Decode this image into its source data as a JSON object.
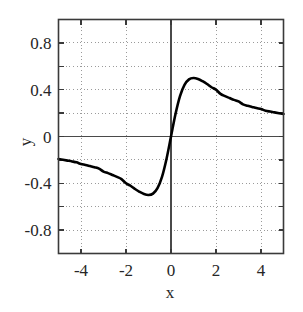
{
  "chart_data": {
    "type": "line",
    "title": "",
    "subtitle": "",
    "xlabel": "x",
    "ylabel": "y",
    "xlim": [
      -5,
      5
    ],
    "ylim": [
      -1.0,
      1.0
    ],
    "grid": true,
    "grid_style": "dotted",
    "legend": null,
    "legend_position": "none",
    "xticks": [
      -4,
      -2,
      0,
      2,
      4
    ],
    "xtick_labels": [
      "-4",
      "-2",
      "0",
      "2",
      "4"
    ],
    "yticks": [
      0.8,
      0.4,
      0,
      -0.4,
      -0.8
    ],
    "ytick_labels": [
      "0.8",
      "0.4",
      "0",
      "-0.4",
      "-0.8"
    ],
    "x_minor_step": 1,
    "y_minor_step": 0.2,
    "series": [
      {
        "name": "y = x/(1+x^2)",
        "color": "#000000",
        "line_width": 2.6,
        "x": [
          -5.0,
          -4.8,
          -4.6,
          -4.4,
          -4.2,
          -4.0,
          -3.8,
          -3.6,
          -3.4,
          -3.2,
          -3.0,
          -2.8,
          -2.6,
          -2.4,
          -2.2,
          -2.0,
          -1.8,
          -1.6,
          -1.4,
          -1.2,
          -1.0,
          -0.8,
          -0.6,
          -0.4,
          -0.2,
          0.0,
          0.2,
          0.4,
          0.6,
          0.8,
          1.0,
          1.2,
          1.4,
          1.6,
          1.8,
          2.0,
          2.2,
          2.4,
          2.6,
          2.8,
          3.0,
          3.2,
          3.4,
          3.6,
          3.8,
          4.0,
          4.2,
          4.4,
          4.6,
          4.8,
          5.0
        ],
        "y": [
          -0.192,
          -0.199,
          -0.206,
          -0.213,
          -0.221,
          -0.235,
          -0.243,
          -0.253,
          -0.263,
          -0.275,
          -0.3,
          -0.313,
          -0.329,
          -0.345,
          -0.364,
          -0.4,
          -0.421,
          -0.449,
          -0.473,
          -0.492,
          -0.5,
          -0.488,
          -0.441,
          -0.345,
          -0.192,
          0.0,
          0.192,
          0.345,
          0.441,
          0.488,
          0.5,
          0.492,
          0.473,
          0.449,
          0.421,
          0.4,
          0.364,
          0.345,
          0.329,
          0.313,
          0.3,
          0.275,
          0.263,
          0.253,
          0.243,
          0.235,
          0.221,
          0.213,
          0.206,
          0.199,
          0.192
        ]
      }
    ],
    "annotations": [
      {
        "label": "peak",
        "x": 1.0,
        "y": 0.5
      },
      {
        "label": "trough",
        "x": -1.0,
        "y": -0.5
      }
    ],
    "colors": {
      "curve": "#000000",
      "frame": "#3a3a3a",
      "grid": "#9a9a9a",
      "zero_axis": "#4a4a4a",
      "background": "#ffffff",
      "text": "#262626"
    }
  }
}
